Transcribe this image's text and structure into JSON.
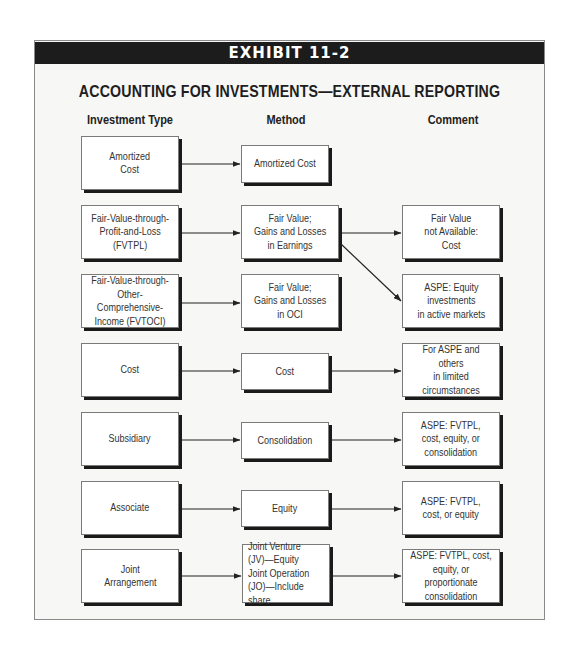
{
  "exhibit": {
    "label": "EXHIBIT 11-2",
    "title": "ACCOUNTING FOR INVESTMENTS—EXTERNAL REPORTING"
  },
  "columns": {
    "investment_type": "Investment Type",
    "method": "Method",
    "comment": "Comment"
  },
  "rows": [
    {
      "investment_type": "Amortized\nCost",
      "method": "Amortized Cost",
      "comment": null
    },
    {
      "investment_type": "Fair-Value-through-\nProfit-and-Loss\n(FVTPL)",
      "method": "Fair Value;\nGains and Losses\nin Earnings",
      "comment": "Fair Value\nnot Available:\nCost"
    },
    {
      "investment_type": "Fair-Value-through-\nOther-Comprehensive-\nIncome (FVTOCI)",
      "method": "Fair Value;\nGains and Losses\nin OCI",
      "comment": "ASPE: Equity\ninvestments\nin active markets"
    },
    {
      "investment_type": "Cost",
      "method": "Cost",
      "comment": "For ASPE and others\nin limited\ncircumstances"
    },
    {
      "investment_type": "Subsidiary",
      "method": "Consolidation",
      "comment": "ASPE: FVTPL,\ncost, equity, or\nconsolidation"
    },
    {
      "investment_type": "Associate",
      "method": "Equity",
      "comment": "ASPE: FVTPL,\ncost, or equity"
    },
    {
      "investment_type": "Joint\nArrangement",
      "method": "Joint Venture\n(JV)—Equity\nJoint Operation\n(JO)—Include share",
      "comment": "ASPE: FVTPL, cost,\nequity, or proportionate\nconsolidation"
    }
  ],
  "connections": [
    {
      "from": "row0.investment_type",
      "to": "row0.method"
    },
    {
      "from": "row1.investment_type",
      "to": "row1.method"
    },
    {
      "from": "row1.method",
      "to": "row1.comment"
    },
    {
      "from": "row1.method",
      "to": "row2.comment",
      "style": "diagonal"
    },
    {
      "from": "row2.investment_type",
      "to": "row2.method"
    },
    {
      "from": "row3.investment_type",
      "to": "row3.method"
    },
    {
      "from": "row3.method",
      "to": "row3.comment"
    },
    {
      "from": "row4.investment_type",
      "to": "row4.method"
    },
    {
      "from": "row4.method",
      "to": "row4.comment"
    },
    {
      "from": "row5.investment_type",
      "to": "row5.method"
    },
    {
      "from": "row5.method",
      "to": "row5.comment"
    },
    {
      "from": "row6.investment_type",
      "to": "row6.method"
    },
    {
      "from": "row6.method",
      "to": "row6.comment"
    }
  ],
  "colors": {
    "header_bar": "#1c1c1c",
    "header_text": "#ffffff",
    "box_fill": "#ffffff",
    "box_shadow": "#1a1a1a",
    "panel_background": "#f7f7f5",
    "arrow": "#222222"
  }
}
